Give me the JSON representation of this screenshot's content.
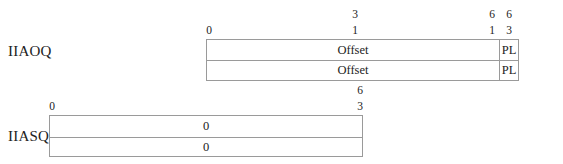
{
  "registers": [
    {
      "name": "IIAOQ",
      "bit_labels": {
        "start": "0",
        "mid_top": "3",
        "mid_bottom": "1",
        "field_end_top": "6",
        "field_end_bottom": "1",
        "end_top": "6",
        "end_bottom": "3"
      },
      "rows": [
        {
          "fields": [
            "Offset",
            "PL"
          ]
        },
        {
          "fields": [
            "Offset",
            "PL"
          ]
        }
      ]
    },
    {
      "name": "IIASQ",
      "bit_labels": {
        "start": "0",
        "end_top": "6",
        "end_bottom": "3"
      },
      "rows": [
        {
          "fields": [
            "0"
          ]
        },
        {
          "fields": [
            "0"
          ]
        }
      ]
    }
  ]
}
